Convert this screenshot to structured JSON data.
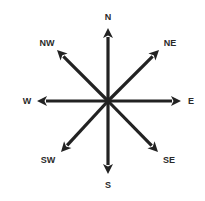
{
  "diagram": {
    "colors": {
      "arrow": "#222222",
      "label": "#2a2a2a",
      "background": "#ffffff"
    },
    "center": [
      108,
      101
    ],
    "directions": [
      {
        "key": "N",
        "label": "N",
        "tip": [
          108,
          28
        ],
        "label_pos": [
          108,
          17
        ]
      },
      {
        "key": "NE",
        "label": "NE",
        "tip": [
          159,
          50
        ],
        "label_pos": [
          170,
          43
        ]
      },
      {
        "key": "E",
        "label": "E",
        "tip": [
          181,
          101
        ],
        "label_pos": [
          191,
          101
        ]
      },
      {
        "key": "SE",
        "label": "SE",
        "tip": [
          158,
          152
        ],
        "label_pos": [
          169,
          160
        ]
      },
      {
        "key": "S",
        "label": "S",
        "tip": [
          108,
          174
        ],
        "label_pos": [
          108,
          185
        ]
      },
      {
        "key": "SW",
        "label": "SW",
        "tip": [
          61,
          152
        ],
        "label_pos": [
          48,
          160
        ]
      },
      {
        "key": "W",
        "label": "W",
        "tip": [
          37,
          101
        ],
        "label_pos": [
          27,
          101
        ]
      },
      {
        "key": "NW",
        "label": "NW",
        "tip": [
          57,
          50
        ],
        "label_pos": [
          47,
          43
        ]
      }
    ]
  }
}
